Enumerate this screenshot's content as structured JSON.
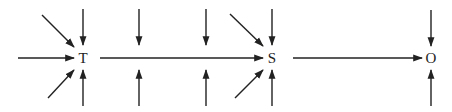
{
  "diagram": {
    "nodes": [
      {
        "id": "T",
        "label": "T",
        "x": 83,
        "y": 58
      },
      {
        "id": "S",
        "label": "S",
        "x": 272,
        "y": 58
      },
      {
        "id": "O",
        "label": "O",
        "x": 431,
        "y": 58
      }
    ],
    "edges": [
      {
        "from": "T",
        "to": "S",
        "type": "main-flow"
      },
      {
        "from": "S",
        "to": "O",
        "type": "main-flow"
      }
    ],
    "external_inputs": {
      "T": [
        "left",
        "upper-left",
        "lower-left",
        "top",
        "bottom"
      ],
      "between_T_S_1": [
        "top",
        "bottom"
      ],
      "between_T_S_2": [
        "top",
        "bottom"
      ],
      "S": [
        "upper-left",
        "lower-left",
        "top",
        "bottom"
      ],
      "O": [
        "top",
        "bottom"
      ]
    },
    "colors": {
      "ink": "#222222",
      "background": "#ffffff"
    }
  }
}
